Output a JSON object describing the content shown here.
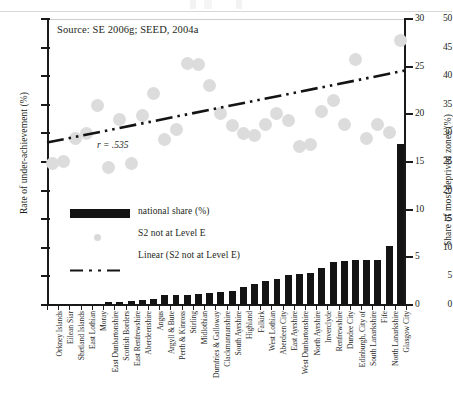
{
  "chart_data": {
    "type": "bar",
    "title": "",
    "source_note": "Source: SE 2006g; SEED, 2004a",
    "annotation": "r = .535",
    "correlation": 0.535,
    "xlabel": "",
    "ylabel": "Rate of under-achievement (%)",
    "y2label": "Share of most deprived zones (%)",
    "ylim": [
      0,
      50
    ],
    "y2lim": [
      0,
      30
    ],
    "yticks": [
      0,
      5,
      10,
      15,
      20,
      25,
      30,
      35,
      40,
      45,
      50
    ],
    "y2ticks": [
      0,
      5,
      10,
      15,
      20,
      25,
      30
    ],
    "grid": false,
    "legend_position": "inside-left",
    "legend": [
      {
        "key": "bar",
        "label": "national share (%)"
      },
      {
        "key": "scatter",
        "label": "S2 not at Level E"
      },
      {
        "key": "line",
        "label": "Linear (S2 not at Level E)"
      }
    ],
    "categories": [
      "Orkney Islands",
      "Eilean Siar",
      "Shetland Islands",
      "East Lothian",
      "Moray",
      "East Dunbartonshire",
      "Scottish Borders",
      "East Renfrewshire",
      "Aberdeenshire",
      "Angus",
      "Argyll & Bute",
      "Perth & Kinross",
      "Stirling",
      "Midlothian",
      "Dumfries & Galloway",
      "Clackmannanshire",
      "South Ayrshire",
      "Highland",
      "Falkirk",
      "West Lothian",
      "Aberdeen City",
      "East Ayrshire",
      "West Dunbartonshire",
      "North Ayrshire",
      "Inverclyde",
      "Renfrewshire",
      "Dundee City",
      "Edinburgh, City of",
      "South Lanarkshire",
      "Fife",
      "North Lanarkshire",
      "Glasgow City"
    ],
    "series": [
      {
        "name": "national share (%)",
        "axis": "right",
        "type": "bar",
        "values": [
          0.05,
          0.05,
          0.05,
          0.1,
          0.15,
          0.3,
          0.35,
          0.4,
          0.5,
          0.6,
          1.0,
          1.0,
          1.1,
          1.2,
          1.3,
          1.4,
          1.5,
          1.9,
          2.2,
          2.5,
          2.7,
          3.1,
          3.3,
          3.4,
          3.9,
          4.5,
          4.6,
          4.7,
          4.7,
          4.75,
          6.2,
          16.9
        ]
      },
      {
        "name": "S2 not at Level E",
        "axis": "left",
        "type": "scatter",
        "values": [
          24.8,
          25.1,
          29.1,
          30.0,
          34.9,
          24.1,
          32.4,
          24.8,
          33.1,
          36.9,
          29.0,
          30.6,
          42.3,
          42.0,
          38.3,
          33.4,
          31.3,
          30.0,
          29.6,
          31.6,
          33.5,
          32.3,
          27.7,
          28.0,
          33.8,
          35.8,
          31.5,
          43.0,
          29.1,
          31.6,
          30.1,
          46.2
        ]
      }
    ],
    "trendline": {
      "name": "Linear (S2 not at Level E)",
      "axis": "left",
      "type": "line",
      "style": "dash-dot",
      "y_start": 28.4,
      "y_end": 41.0
    }
  },
  "axes": {
    "left": {
      "title": "Rate of under-achievement (%)",
      "ticks": [
        "0",
        "5",
        "10",
        "15",
        "20",
        "25",
        "30",
        "35",
        "40",
        "45",
        "50"
      ]
    },
    "right": {
      "title": "Share of most deprived zones (%)",
      "ticks": [
        "0",
        "5",
        "10",
        "15",
        "20",
        "25",
        "30"
      ]
    }
  }
}
